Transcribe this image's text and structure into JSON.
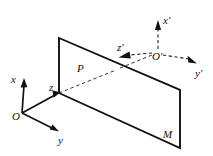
{
  "figure": {
    "background_color": "#ffffff",
    "stroke_color": "#111111",
    "labels": {
      "x_axis": "x",
      "y_axis": "y",
      "z_axis": "z",
      "origin": "O",
      "x_prime_axis": "x′",
      "y_prime_axis": "y′",
      "z_prime_axis": "z′",
      "origin_prime": "O′",
      "point_p": "P",
      "plane_m": "M"
    },
    "frames": [
      {
        "name": "unprimed-frame",
        "origin_label": "O",
        "origin_xy": [
          22,
          113
        ],
        "line_style": "solid",
        "axes": [
          {
            "label": "x",
            "direction": "up",
            "tip_xy": [
              24,
              80
            ],
            "label_xy": [
              15,
              79
            ]
          },
          {
            "label": "y",
            "direction": "down-right",
            "tip_xy": [
              58,
              131
            ],
            "label_xy": [
              62,
              140
            ]
          },
          {
            "label": "z",
            "direction": "down-right-short",
            "tip_xy": [
              60,
              93
            ],
            "label_xy": [
              52,
              89
            ]
          }
        ]
      },
      {
        "name": "primed-frame",
        "origin_label": "O′",
        "origin_xy": [
          158,
          53
        ],
        "line_style": "dashed",
        "axes": [
          {
            "label": "x′",
            "direction": "up",
            "tip_xy": [
              158,
              21
            ],
            "label_xy": [
              164,
              20
            ]
          },
          {
            "label": "y′",
            "direction": "down-right",
            "tip_xy": [
              197,
              63
            ],
            "label_xy": [
              198,
              73
            ]
          },
          {
            "label": "z′",
            "direction": "left-down",
            "tip_xy": [
              119,
              57
            ],
            "label_xy": [
              121,
              49
            ]
          }
        ]
      }
    ],
    "plane": {
      "name": "plane-m",
      "label": "M",
      "label_xy": [
        166,
        134
      ],
      "vertices": [
        [
          59,
          38
        ],
        [
          180,
          90
        ],
        [
          180,
          148
        ],
        [
          59,
          93
        ]
      ],
      "fill": "none",
      "stroke_width": 1.9
    },
    "ray": {
      "name": "ray-p",
      "label": "P",
      "label_xy": [
        80,
        70
      ],
      "from_xy": [
        59,
        93
      ],
      "to_xy": [
        158,
        53
      ],
      "line_style": "dashed"
    }
  }
}
